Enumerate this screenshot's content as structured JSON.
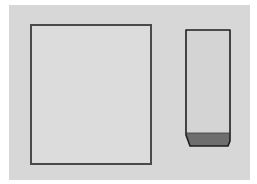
{
  "diagram": {
    "colors": {
      "outer_margin": "#ffffff",
      "panel_background": "#d7d7d7",
      "big_rect_fill": "#dcdcdc",
      "big_rect_border": "#4a4a4a",
      "tall_box_fill": "#d4d4d4",
      "tall_box_border": "#1e1e1e",
      "tall_box_base_fill": "#6e6e6e"
    },
    "shapes": [
      {
        "name": "large-rectangle",
        "type": "rectangle"
      },
      {
        "name": "tall-container",
        "type": "container-with-base"
      }
    ]
  }
}
